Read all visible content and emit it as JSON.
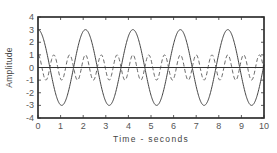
{
  "chart_data": {
    "type": "line",
    "title": "",
    "xlabel": "Time - seconds",
    "ylabel": "Amplitude",
    "xlim": [
      0,
      10
    ],
    "ylim": [
      -4,
      4
    ],
    "x_ticks": [
      "0",
      "1",
      "2",
      "3",
      "4",
      "5",
      "6",
      "7",
      "8",
      "9",
      "10"
    ],
    "y_ticks": [
      "4",
      "3",
      "2",
      "1",
      "0",
      "-1",
      "-2",
      "-3",
      "-4"
    ],
    "grid": false,
    "legend": null,
    "zero_line": true,
    "series": [
      {
        "name": "fundamental",
        "style": "solid",
        "amplitude": 3,
        "period": 2.1,
        "phase": 0,
        "color": "#444444"
      },
      {
        "name": "third harmonic",
        "style": "dashed",
        "amplitude": 1,
        "period": 0.7,
        "phase": 0,
        "color": "#666666"
      }
    ]
  },
  "frame": {
    "left": 38,
    "top": 17,
    "right": 264,
    "bottom": 118
  }
}
